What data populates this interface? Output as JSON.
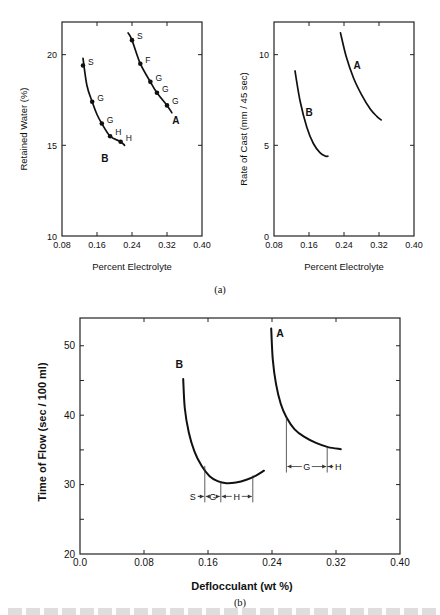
{
  "figure": {
    "panel_a_label": "(a)",
    "panel_b_label": "(b)",
    "caption_partial": ""
  },
  "chart_data": [
    {
      "id": "retained-water",
      "type": "line",
      "title": "",
      "xlabel": "Percent Electrolyte",
      "ylabel": "Retained Water  (%)",
      "xlim": [
        0.08,
        0.4
      ],
      "ylim": [
        10,
        21.8
      ],
      "xticks": [
        0.08,
        0.16,
        0.24,
        0.32,
        0.4
      ],
      "xtick_labels": [
        "0.08",
        "0.16",
        "0.24",
        "0.32",
        "0.40"
      ],
      "yticks": [
        10,
        15,
        20
      ],
      "ytick_labels": [
        "10",
        "15",
        "20"
      ],
      "grid": false,
      "series": [
        {
          "name": "B",
          "curve": [
            [
              0.128,
              19.8
            ],
            [
              0.137,
              18.3
            ],
            [
              0.149,
              17.4
            ],
            [
              0.16,
              16.7
            ],
            [
              0.171,
              16.2
            ],
            [
              0.19,
              15.5
            ],
            [
              0.214,
              15.2
            ],
            [
              0.223,
              15.0
            ]
          ],
          "points": [
            {
              "x": 0.128,
              "y": 19.4,
              "label": "S"
            },
            {
              "x": 0.149,
              "y": 17.4,
              "label": "G"
            },
            {
              "x": 0.171,
              "y": 16.2,
              "label": "G"
            },
            {
              "x": 0.19,
              "y": 15.5,
              "label": "H"
            },
            {
              "x": 0.214,
              "y": 15.2,
              "label": "H"
            }
          ],
          "label_pos": [
            0.178,
            14.1
          ]
        },
        {
          "name": "A",
          "curve": [
            [
              0.231,
              21.2
            ],
            [
              0.24,
              20.8
            ],
            [
              0.259,
              19.5
            ],
            [
              0.282,
              18.5
            ],
            [
              0.297,
              17.9
            ],
            [
              0.32,
              17.2
            ],
            [
              0.331,
              16.8
            ]
          ],
          "points": [
            {
              "x": 0.24,
              "y": 20.8,
              "label": "S"
            },
            {
              "x": 0.259,
              "y": 19.5,
              "label": "F"
            },
            {
              "x": 0.282,
              "y": 18.5,
              "label": "G"
            },
            {
              "x": 0.297,
              "y": 17.9,
              "label": "G"
            },
            {
              "x": 0.32,
              "y": 17.2,
              "label": "G"
            }
          ],
          "label_pos": [
            0.34,
            16.2
          ]
        }
      ]
    },
    {
      "id": "rate-of-cast",
      "type": "line",
      "title": "",
      "xlabel": "Percent Electrolyte",
      "ylabel": "Rate of Cast  (mm / 45 sec)",
      "xlim": [
        0.08,
        0.4
      ],
      "ylim": [
        0,
        11.8
      ],
      "xticks": [
        0.08,
        0.16,
        0.24,
        0.32,
        0.4
      ],
      "xtick_labels": [
        "0.08",
        "0.16",
        "0.24",
        "0.32",
        "0.40"
      ],
      "yticks": [
        0,
        5,
        10
      ],
      "ytick_labels": [
        "0",
        "5",
        "10"
      ],
      "grid": false,
      "series": [
        {
          "name": "B",
          "curve": [
            [
              0.128,
              9.1
            ],
            [
              0.14,
              7.4
            ],
            [
              0.155,
              6.0
            ],
            [
              0.17,
              5.1
            ],
            [
              0.185,
              4.6
            ],
            [
              0.198,
              4.4
            ],
            [
              0.203,
              4.4
            ]
          ],
          "label_pos": [
            0.16,
            6.6
          ]
        },
        {
          "name": "A",
          "curve": [
            [
              0.232,
              11.2
            ],
            [
              0.245,
              9.9
            ],
            [
              0.262,
              8.7
            ],
            [
              0.28,
              7.8
            ],
            [
              0.3,
              7.0
            ],
            [
              0.315,
              6.6
            ],
            [
              0.325,
              6.4
            ]
          ],
          "label_pos": [
            0.27,
            9.2
          ]
        }
      ]
    },
    {
      "id": "time-of-flow",
      "type": "line",
      "title": "",
      "xlabel": "Deflocculant  (wt %)",
      "ylabel": "Time of Flow  (sec / 100 ml)",
      "xlim": [
        0.0,
        0.4
      ],
      "ylim": [
        20,
        54
      ],
      "xticks": [
        0.0,
        0.08,
        0.16,
        0.24,
        0.32,
        0.4
      ],
      "xtick_labels": [
        "0.0",
        "0.08",
        "0.16",
        "0.24",
        "0.32",
        "0.40"
      ],
      "yticks": [
        20,
        25,
        30,
        35,
        40,
        45,
        50
      ],
      "ytick_labels": [
        "20",
        "",
        "30",
        "",
        "40",
        "",
        "50"
      ],
      "grid": false,
      "series": [
        {
          "name": "B",
          "curve": [
            [
              0.129,
              45.2
            ],
            [
              0.131,
              41.0
            ],
            [
              0.136,
              37.5
            ],
            [
              0.143,
              34.8
            ],
            [
              0.152,
              32.7
            ],
            [
              0.162,
              31.2
            ],
            [
              0.172,
              30.5
            ],
            [
              0.183,
              30.2
            ],
            [
              0.195,
              30.3
            ],
            [
              0.208,
              30.7
            ],
            [
              0.22,
              31.3
            ],
            [
              0.23,
              32.0
            ]
          ],
          "label_pos": [
            0.124,
            46.8
          ],
          "ranges": [
            {
              "label": "S",
              "from": null,
              "to": 0.156
            },
            {
              "label": "G",
              "from": 0.156,
              "to": 0.176
            },
            {
              "label": "H",
              "from": 0.176,
              "to": 0.216
            }
          ],
          "range_y": 28.3
        },
        {
          "name": "A",
          "curve": [
            [
              0.239,
              52.5
            ],
            [
              0.241,
              48.0
            ],
            [
              0.245,
              44.5
            ],
            [
              0.251,
              41.6
            ],
            [
              0.258,
              39.7
            ],
            [
              0.268,
              38.0
            ],
            [
              0.28,
              36.9
            ],
            [
              0.295,
              36.0
            ],
            [
              0.31,
              35.4
            ],
            [
              0.326,
              35.1
            ]
          ],
          "label_pos": [
            0.25,
            51.2
          ],
          "ranges": [
            {
              "label": "G",
              "from": 0.258,
              "to": 0.309
            },
            {
              "label": "H",
              "from": 0.309,
              "to": null
            }
          ],
          "range_y": 32.6
        }
      ]
    }
  ]
}
